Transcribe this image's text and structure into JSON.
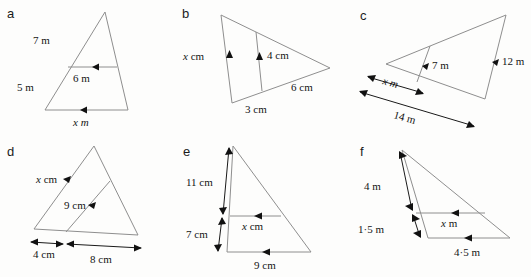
{
  "page": {
    "background_color": "#fdfdfc",
    "shape_stroke_color": "#8e8e8e",
    "dimension_stroke_color": "#1a1a1a",
    "label_color": "#141414"
  },
  "panels": [
    {
      "letter": "a",
      "name": "panel-a",
      "description": "Triangle with apex at top and a horizontal line parallel to the base",
      "labels": [
        {
          "id": "a-side-7m",
          "text": "7 m",
          "role": "upper-left-side-length"
        },
        {
          "id": "a-side-5m",
          "text": "5 m",
          "role": "lower-left-side-length"
        },
        {
          "id": "a-mid-6m",
          "text": "6 m",
          "role": "internal-parallel-line-length"
        },
        {
          "id": "a-base-xm",
          "text": "x m",
          "role": "base-unknown-length"
        }
      ]
    },
    {
      "letter": "b",
      "name": "panel-b",
      "description": "Triangle pointing right with a vertical line parallel to the left edge",
      "labels": [
        {
          "id": "b-left-xcm",
          "text": "x cm",
          "role": "left-edge-unknown-length"
        },
        {
          "id": "b-mid-4cm",
          "text": "4 cm",
          "role": "internal-parallel-line-length"
        },
        {
          "id": "b-base-3cm",
          "text": "3 cm",
          "role": "lower-left-base-length"
        },
        {
          "id": "b-side-6cm",
          "text": "6 cm",
          "role": "lower-right-side-length"
        }
      ]
    },
    {
      "letter": "c",
      "name": "panel-c",
      "description": "Tilted triangle with apex at upper right and an internal line parallel to the right side",
      "labels": [
        {
          "id": "c-mid-7m",
          "text": "7 m",
          "role": "internal-parallel-line-length"
        },
        {
          "id": "c-right-12m",
          "text": "12 m",
          "role": "right-side-length"
        },
        {
          "id": "c-dim-xm",
          "text": "x m",
          "role": "partial-base-unknown-length"
        },
        {
          "id": "c-dim-14m",
          "text": "14 m",
          "role": "full-base-length"
        }
      ]
    },
    {
      "letter": "d",
      "name": "panel-d",
      "description": "Triangle with an internal line parallel to the left side meeting the base",
      "labels": [
        {
          "id": "d-left-xcm",
          "text": "x cm",
          "role": "left-side-unknown-length"
        },
        {
          "id": "d-mid-9cm",
          "text": "9 cm",
          "role": "internal-parallel-line-length"
        },
        {
          "id": "d-dim-4cm",
          "text": "4 cm",
          "role": "left-base-segment-length"
        },
        {
          "id": "d-dim-8cm",
          "text": "8 cm",
          "role": "right-base-segment-length"
        }
      ]
    },
    {
      "letter": "e",
      "name": "panel-e",
      "description": "Tall triangle with a horizontal line parallel to the base, left side split into two dimensioned parts",
      "labels": [
        {
          "id": "e-dim-11cm",
          "text": "11 cm",
          "role": "upper-left-side-segment-length"
        },
        {
          "id": "e-dim-7cm",
          "text": "7 cm",
          "role": "lower-left-side-segment-length"
        },
        {
          "id": "e-mid-xcm",
          "text": "x cm",
          "role": "internal-parallel-line-unknown-length"
        },
        {
          "id": "e-base-9cm",
          "text": "9 cm",
          "role": "base-length"
        }
      ]
    },
    {
      "letter": "f",
      "name": "panel-f",
      "description": "Slanted narrow triangle with a line parallel to the base, left side split into two dimensioned parts",
      "labels": [
        {
          "id": "f-dim-4m",
          "text": "4 m",
          "role": "upper-left-side-segment-length"
        },
        {
          "id": "f-dim-1-5m",
          "text": "1·5 m",
          "role": "lower-left-side-segment-length"
        },
        {
          "id": "f-mid-xm",
          "text": "x m",
          "role": "internal-parallel-line-unknown-length"
        },
        {
          "id": "f-base-4-5m",
          "text": "4·5 m",
          "role": "base-length"
        }
      ]
    }
  ]
}
